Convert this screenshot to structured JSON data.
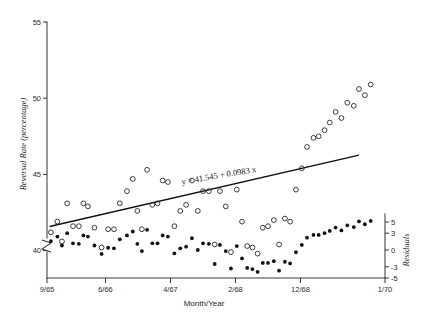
{
  "chart_data": {
    "type": "scatter",
    "title": "",
    "subtitle": "",
    "xlabel": "Month/Year",
    "ylabel": "Reversal Rate (percentage)",
    "y2label": "Residuals",
    "grid": false,
    "legend_position": "none",
    "xlim": [
      0,
      52
    ],
    "ylim": [
      38.2,
      55
    ],
    "y2lim": [
      -5,
      5
    ],
    "x_tick_labels": [
      "9/65",
      "6/66",
      "4/67",
      "2/68",
      "12/68",
      "1/70"
    ],
    "x_tick_values": [
      0,
      9,
      19,
      29,
      39,
      52
    ],
    "y_tick_labels": [
      "55",
      "50",
      "45",
      "40"
    ],
    "y_tick_values": [
      55,
      50,
      45,
      40
    ],
    "y2_tick_labels": [
      "5",
      "3",
      "0",
      "-3",
      "-5"
    ],
    "y2_tick_values": [
      5,
      3,
      0,
      -3,
      -5
    ],
    "axis_break": true,
    "annotations": [
      {
        "name": "regression-equation",
        "text": "y = 41.545 + 0.0983 x",
        "x": 26.5,
        "y": 44.75,
        "rotation": -9.5
      }
    ],
    "fit_line": {
      "name": "least-squares-fit",
      "intercept": 41.545,
      "slope": 0.0983,
      "x_start": 0.4,
      "x_end": 48.0
    },
    "series": [
      {
        "name": "Reversal Rate",
        "marker": "open-circle",
        "axis": "left",
        "points": [
          [
            0.6,
            41.2
          ],
          [
            1.6,
            41.9
          ],
          [
            2.3,
            40.6
          ],
          [
            3.1,
            43.1
          ],
          [
            4.0,
            41.6
          ],
          [
            4.9,
            41.6
          ],
          [
            5.6,
            43.1
          ],
          [
            6.3,
            42.9
          ],
          [
            7.3,
            41.5
          ],
          [
            8.4,
            40.2
          ],
          [
            9.4,
            41.4
          ],
          [
            10.3,
            41.4
          ],
          [
            11.2,
            43.1
          ],
          [
            12.3,
            43.9
          ],
          [
            13.2,
            44.7
          ],
          [
            13.9,
            42.6
          ],
          [
            14.6,
            41.4
          ],
          [
            15.4,
            45.3
          ],
          [
            16.2,
            43.0
          ],
          [
            17.0,
            43.1
          ],
          [
            17.8,
            44.6
          ],
          [
            18.6,
            44.5
          ],
          [
            19.6,
            41.6
          ],
          [
            20.5,
            42.6
          ],
          [
            21.4,
            43.0
          ],
          [
            22.3,
            44.6
          ],
          [
            23.2,
            42.6
          ],
          [
            24.0,
            43.9
          ],
          [
            24.9,
            43.9
          ],
          [
            25.8,
            40.4
          ],
          [
            26.6,
            43.9
          ],
          [
            27.5,
            42.9
          ],
          [
            28.3,
            39.9
          ],
          [
            29.2,
            44.0
          ],
          [
            30.0,
            41.9
          ],
          [
            30.8,
            40.3
          ],
          [
            31.6,
            40.2
          ],
          [
            32.4,
            39.8
          ],
          [
            33.2,
            41.5
          ],
          [
            34.0,
            41.6
          ],
          [
            34.9,
            42.0
          ],
          [
            35.7,
            40.4
          ],
          [
            36.6,
            42.1
          ],
          [
            37.4,
            41.9
          ],
          [
            38.3,
            44.0
          ],
          [
            39.2,
            45.4
          ],
          [
            40.0,
            46.8
          ],
          [
            41.0,
            47.4
          ],
          [
            41.8,
            47.5
          ],
          [
            42.7,
            47.9
          ],
          [
            43.5,
            48.4
          ],
          [
            44.4,
            49.1
          ],
          [
            45.3,
            48.7
          ],
          [
            46.2,
            49.7
          ],
          [
            47.2,
            49.5
          ],
          [
            48.0,
            50.6
          ],
          [
            48.9,
            50.2
          ],
          [
            49.8,
            50.9
          ]
        ]
      },
      {
        "name": "Residuals",
        "marker": "filled-circle",
        "axis": "right",
        "points": [
          [
            0.6,
            1.6
          ],
          [
            1.6,
            2.4
          ],
          [
            2.3,
            0.8
          ],
          [
            3.1,
            3.0
          ],
          [
            4.0,
            1.2
          ],
          [
            4.9,
            1.1
          ],
          [
            5.6,
            2.6
          ],
          [
            6.3,
            2.4
          ],
          [
            7.3,
            0.8
          ],
          [
            8.4,
            -0.7
          ],
          [
            9.4,
            0.4
          ],
          [
            10.3,
            0.3
          ],
          [
            11.2,
            1.9
          ],
          [
            12.3,
            2.6
          ],
          [
            13.2,
            3.3
          ],
          [
            13.9,
            1.1
          ],
          [
            14.6,
            -0.2
          ],
          [
            15.4,
            3.6
          ],
          [
            16.2,
            1.2
          ],
          [
            17.0,
            1.2
          ],
          [
            17.8,
            2.6
          ],
          [
            18.6,
            2.4
          ],
          [
            19.6,
            -0.6
          ],
          [
            20.5,
            0.3
          ],
          [
            21.4,
            0.6
          ],
          [
            22.3,
            2.1
          ],
          [
            23.2,
            0.0
          ],
          [
            24.0,
            1.2
          ],
          [
            24.9,
            1.1
          ],
          [
            25.8,
            -2.5
          ],
          [
            26.6,
            0.9
          ],
          [
            27.5,
            -0.2
          ],
          [
            28.3,
            -3.3
          ],
          [
            29.2,
            0.7
          ],
          [
            30.0,
            -1.5
          ],
          [
            30.8,
            -3.2
          ],
          [
            31.6,
            -3.4
          ],
          [
            32.4,
            -3.9
          ],
          [
            33.2,
            -2.3
          ],
          [
            34.0,
            -2.3
          ],
          [
            34.9,
            -2.0
          ],
          [
            35.7,
            -3.7
          ],
          [
            36.6,
            -2.1
          ],
          [
            37.4,
            -2.4
          ],
          [
            38.3,
            -0.4
          ],
          [
            39.2,
            0.9
          ],
          [
            40.0,
            2.2
          ],
          [
            41.0,
            2.7
          ],
          [
            41.8,
            2.7
          ],
          [
            42.7,
            3.0
          ],
          [
            43.5,
            3.4
          ],
          [
            44.4,
            4.0
          ],
          [
            45.3,
            3.5
          ],
          [
            46.2,
            4.4
          ],
          [
            47.2,
            4.1
          ],
          [
            48.0,
            5.1
          ],
          [
            48.9,
            4.6
          ],
          [
            49.8,
            5.2
          ]
        ]
      }
    ]
  },
  "axes": {
    "y_left_title": "Reversal Rate (percentage)",
    "y_right_title": "Residuals",
    "x_title": "Month/Year"
  }
}
